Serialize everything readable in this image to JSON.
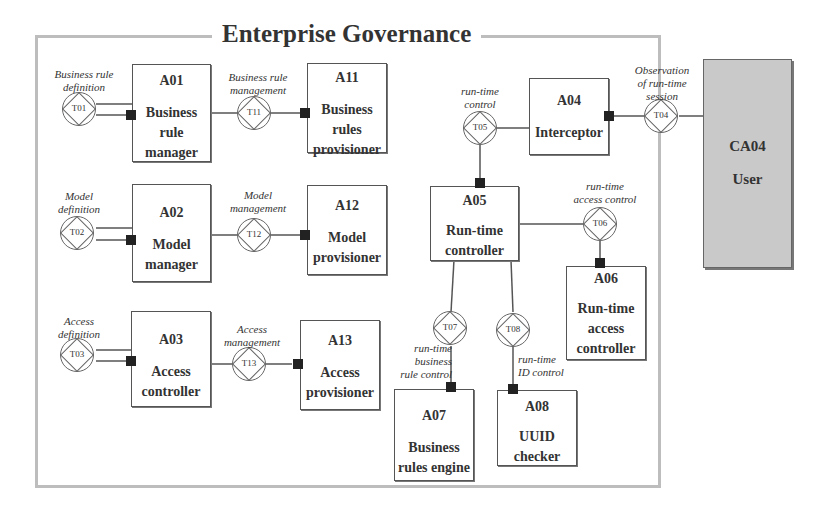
{
  "diagram": {
    "title": "Enterprise Governance",
    "actors": {
      "A01": {
        "id": "A01",
        "label": "Business rule manager",
        "lines": [
          "Business",
          "rule",
          "manager"
        ]
      },
      "A11": {
        "id": "A11",
        "label": "Business rules provisioner",
        "lines": [
          "Business",
          "rules",
          "provisioner"
        ]
      },
      "A02": {
        "id": "A02",
        "label": "Model manager",
        "lines": [
          "Model",
          "manager"
        ]
      },
      "A12": {
        "id": "A12",
        "label": "Model provisioner",
        "lines": [
          "Model",
          "provisioner"
        ]
      },
      "A03": {
        "id": "A03",
        "label": "Access controller",
        "lines": [
          "Access",
          "controller"
        ]
      },
      "A13": {
        "id": "A13",
        "label": "Access provisioner",
        "lines": [
          "Access",
          "provisioner"
        ]
      },
      "A04": {
        "id": "A04",
        "label": "Interceptor",
        "lines": [
          "Interceptor"
        ]
      },
      "A05": {
        "id": "A05",
        "label": "Run-time controller",
        "lines": [
          "Run-time",
          "controller"
        ]
      },
      "A06": {
        "id": "A06",
        "label": "Run-time access controller",
        "lines": [
          "Run-time",
          "access",
          "controller"
        ]
      },
      "A07": {
        "id": "A07",
        "label": "Business rules engine",
        "lines": [
          "Business",
          "rules engine"
        ]
      },
      "A08": {
        "id": "A08",
        "label": "UUID checker",
        "lines": [
          "UUID",
          "checker"
        ]
      },
      "CA04": {
        "id": "CA04",
        "label": "User",
        "lines": [
          "User"
        ]
      }
    },
    "transactions": {
      "T01": {
        "id": "T01",
        "caption": [
          "Business rule",
          "definition"
        ]
      },
      "T11": {
        "id": "T11",
        "caption": [
          "Business rule",
          "management"
        ]
      },
      "T02": {
        "id": "T02",
        "caption": [
          "Model",
          "definition"
        ]
      },
      "T12": {
        "id": "T12",
        "caption": [
          "Model",
          "management"
        ]
      },
      "T03": {
        "id": "T03",
        "caption": [
          "Access",
          "definition"
        ]
      },
      "T13": {
        "id": "T13",
        "caption": [
          "Access",
          "management"
        ]
      },
      "T04": {
        "id": "T04",
        "caption": [
          "Observation",
          "of run-time",
          "session"
        ]
      },
      "T05": {
        "id": "T05",
        "caption": [
          "run-time",
          "control"
        ]
      },
      "T06": {
        "id": "T06",
        "caption": [
          "run-time",
          "access control"
        ]
      },
      "T07": {
        "id": "T07",
        "caption": [
          "run-time",
          "business",
          "rule control"
        ]
      },
      "T08": {
        "id": "T08",
        "caption": [
          "run-time",
          "ID control"
        ]
      }
    },
    "colors": {
      "frame": "#bdbdbd",
      "user_fill": "#c9c9c9",
      "port": "#222222",
      "line": "#555555"
    }
  }
}
